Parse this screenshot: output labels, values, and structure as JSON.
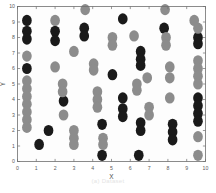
{
  "figure": {
    "caption": "(a) Dataset"
  },
  "chart_data": {
    "type": "scatter",
    "title": "",
    "xlabel": "X",
    "ylabel": "Y",
    "xlim": [
      0,
      10
    ],
    "ylim": [
      0,
      10
    ],
    "xticks": [
      0,
      1,
      2,
      3,
      4,
      5,
      6,
      7,
      8,
      9,
      10
    ],
    "yticks": [
      0,
      1,
      2,
      3,
      4,
      5,
      6,
      7,
      8,
      9,
      10
    ],
    "xticklabels": [
      "0",
      "1",
      "2",
      "3",
      "4",
      "5",
      "6",
      "7",
      "8",
      "9",
      "10"
    ],
    "yticklabels": [
      "0",
      "1",
      "2",
      "3",
      "4",
      "5",
      "6",
      "7",
      "8",
      "9",
      "10"
    ],
    "grid": false,
    "legend": null,
    "marker": "circle",
    "marker_size_px": 11,
    "series": [
      {
        "name": "class-dark",
        "color": "#1a1a1a",
        "points": [
          [
            0.5,
            9.1
          ],
          [
            0.5,
            8.4
          ],
          [
            0.5,
            7.9
          ],
          [
            0.5,
            6.0
          ],
          [
            1.15,
            1.1
          ],
          [
            1.65,
            2.0
          ],
          [
            2.0,
            8.4
          ],
          [
            2.0,
            7.8
          ],
          [
            2.45,
            3.9
          ],
          [
            3.55,
            8.6
          ],
          [
            3.55,
            8.1
          ],
          [
            4.5,
            2.4
          ],
          [
            4.5,
            0.4
          ],
          [
            5.05,
            5.6
          ],
          [
            5.6,
            9.2
          ],
          [
            5.6,
            4.1
          ],
          [
            5.6,
            3.4
          ],
          [
            5.6,
            2.9
          ],
          [
            6.45,
            0.4
          ],
          [
            6.55,
            7.1
          ],
          [
            6.55,
            6.6
          ],
          [
            6.55,
            6.2
          ],
          [
            6.55,
            2.5
          ],
          [
            6.55,
            2.0
          ],
          [
            7.8,
            8.6
          ],
          [
            8.25,
            2.4
          ],
          [
            8.25,
            1.9
          ],
          [
            8.25,
            1.4
          ],
          [
            9.6,
            8.0
          ],
          [
            9.6,
            7.6
          ],
          [
            9.6,
            4.1
          ],
          [
            9.6,
            3.6
          ],
          [
            9.6,
            3.1
          ],
          [
            9.6,
            2.6
          ]
        ]
      },
      {
        "name": "class-gray",
        "color": "#8c8c8c",
        "points": [
          [
            0.5,
            6.8
          ],
          [
            0.5,
            5.2
          ],
          [
            0.5,
            4.7
          ],
          [
            0.5,
            4.2
          ],
          [
            0.5,
            3.7
          ],
          [
            0.5,
            3.2
          ],
          [
            0.5,
            2.7
          ],
          [
            0.5,
            2.2
          ],
          [
            2.0,
            9.1
          ],
          [
            2.0,
            6.1
          ],
          [
            2.4,
            5.0
          ],
          [
            2.4,
            4.5
          ],
          [
            2.45,
            3.0
          ],
          [
            3.0,
            7.1
          ],
          [
            3.0,
            2.0
          ],
          [
            3.0,
            1.5
          ],
          [
            3.0,
            1.1
          ],
          [
            3.6,
            9.8
          ],
          [
            4.05,
            6.3
          ],
          [
            4.05,
            5.9
          ],
          [
            4.25,
            4.5
          ],
          [
            4.25,
            4.0
          ],
          [
            4.25,
            3.5
          ],
          [
            4.55,
            1.5
          ],
          [
            4.55,
            1.1
          ],
          [
            5.05,
            8.0
          ],
          [
            5.05,
            7.5
          ],
          [
            6.2,
            8.1
          ],
          [
            6.35,
            5.0
          ],
          [
            6.35,
            4.6
          ],
          [
            6.9,
            5.4
          ],
          [
            7.0,
            3.5
          ],
          [
            7.0,
            3.0
          ],
          [
            7.85,
            9.8
          ],
          [
            7.9,
            8.0
          ],
          [
            7.9,
            7.5
          ],
          [
            8.1,
            6.1
          ],
          [
            8.1,
            5.4
          ],
          [
            8.1,
            4.1
          ],
          [
            9.4,
            9.1
          ],
          [
            9.6,
            8.6
          ],
          [
            9.6,
            6.5
          ],
          [
            9.6,
            6.0
          ],
          [
            9.6,
            5.5
          ],
          [
            9.6,
            5.0
          ],
          [
            9.6,
            1.6
          ],
          [
            9.6,
            0.4
          ]
        ]
      }
    ]
  }
}
